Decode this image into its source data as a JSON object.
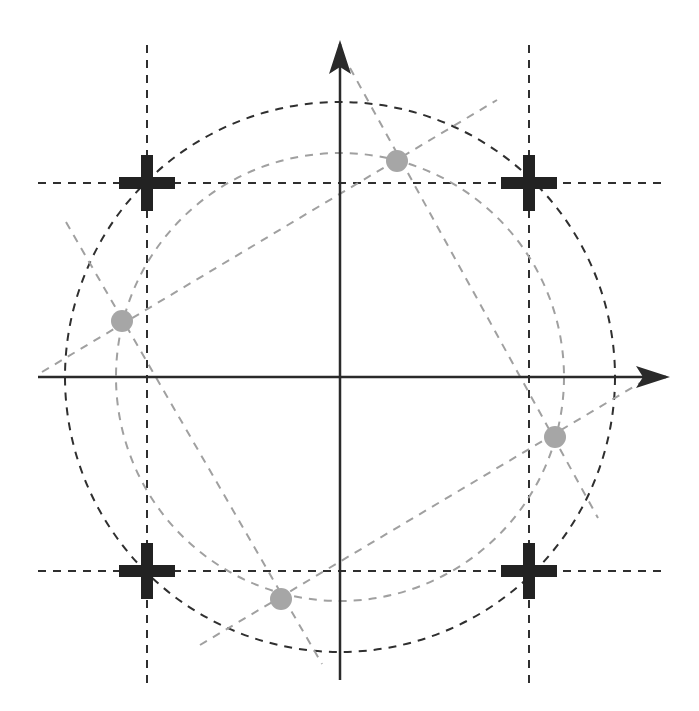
{
  "diagram": {
    "type": "constellation",
    "width": 699,
    "height": 711,
    "origin": [
      340,
      377
    ],
    "colors": {
      "axis": "#2a2a2a",
      "dark_dashed": "#2f2f2f",
      "light_dashed": "#a0a0a0",
      "cross_marker": "#222222",
      "dot_marker": "#a6a6a6"
    },
    "axes": {
      "x": {
        "from": [
          38,
          377
        ],
        "to": [
          666,
          377
        ]
      },
      "y": {
        "from": [
          340,
          680
        ],
        "to": [
          340,
          44
        ]
      }
    },
    "outer_circle": {
      "cx": 340,
      "cy": 377,
      "r": 275
    },
    "inner_circle": {
      "cx": 340,
      "cy": 377,
      "r": 224
    },
    "ideal_points": [
      {
        "label": "cross-top-left",
        "x": 147,
        "y": 183
      },
      {
        "label": "cross-top-right",
        "x": 529,
        "y": 183
      },
      {
        "label": "cross-bottom-left",
        "x": 147,
        "y": 571
      },
      {
        "label": "cross-bottom-right",
        "x": 529,
        "y": 571
      }
    ],
    "rotated_points": [
      {
        "label": "dot-top",
        "x": 397,
        "y": 161
      },
      {
        "label": "dot-left",
        "x": 122,
        "y": 321
      },
      {
        "label": "dot-right",
        "x": 555,
        "y": 437
      },
      {
        "label": "dot-bottom",
        "x": 281,
        "y": 599
      }
    ]
  }
}
